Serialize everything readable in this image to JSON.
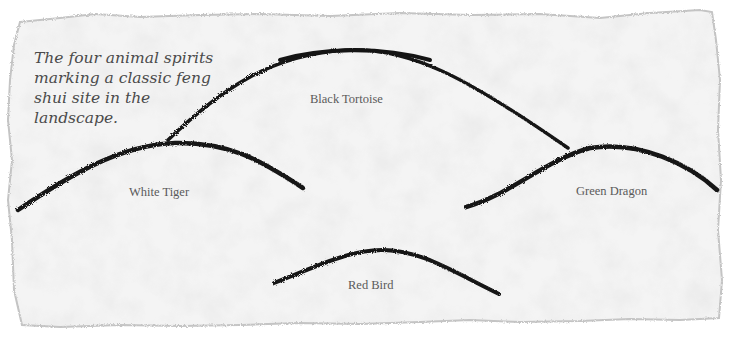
{
  "caption": "The four animal spirits marking a classic feng shui site in the landscape.",
  "labels": {
    "black_tortoise": "Black Tortoise",
    "white_tiger": "White Tiger",
    "green_dragon": "Green Dragon",
    "red_bird": "Red Bird"
  },
  "colors": {
    "paper": "#f3f3f3",
    "paper_edge": "#bdbdbd",
    "ink": "#141414",
    "caption_text": "#4a4a4a",
    "label_text": "#5a5a5a"
  }
}
